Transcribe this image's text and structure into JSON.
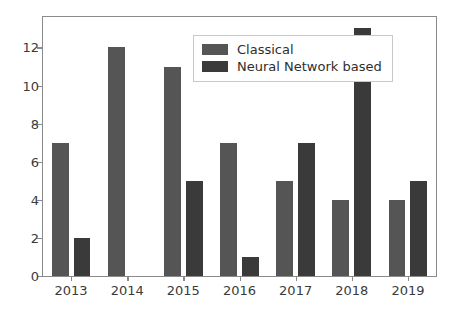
{
  "chart_data": {
    "type": "bar",
    "title": "",
    "subtitle": "",
    "xlabel": "",
    "ylabel": "",
    "categories": [
      "2013",
      "2014",
      "2015",
      "2016",
      "2017",
      "2018",
      "2019"
    ],
    "series": [
      {
        "name": "Classical",
        "color": "#555555",
        "values": [
          7,
          12,
          11,
          7,
          5,
          4,
          4
        ]
      },
      {
        "name": "Neural Network based",
        "color": "#3a3a3a",
        "values": [
          2,
          0,
          5,
          1,
          7,
          13,
          5
        ]
      }
    ],
    "ylim": [
      0,
      13.6
    ],
    "yticks": [
      0,
      2,
      4,
      6,
      8,
      10,
      12
    ],
    "ytick_labels": [
      "0",
      "2",
      "4",
      "6",
      "8",
      "10",
      "12"
    ],
    "xtick_labels": [
      "2013",
      "2014",
      "2015",
      "2016",
      "2017",
      "2018",
      "2019"
    ],
    "grid": false,
    "legend_position": "upper center",
    "legend_entries": [
      "Classical",
      "Neural Network based"
    ],
    "axis_color": "#8a8a8a",
    "background_color": "#ffffff",
    "annotations": []
  }
}
